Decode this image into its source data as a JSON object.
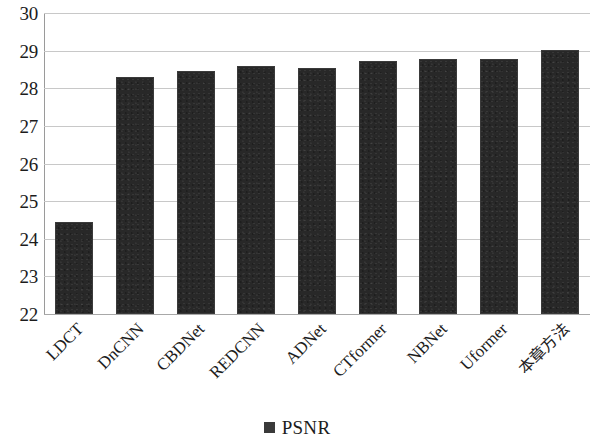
{
  "chart_data": {
    "type": "bar",
    "title": "",
    "subtitle": "",
    "xlabel": "",
    "ylabel": "",
    "categories": [
      "LDCT",
      "DnCNN",
      "CBDNet",
      "REDCNN",
      "ADNet",
      "CTformer",
      "NBNet",
      "Uformer",
      "本章方法"
    ],
    "series": [
      {
        "name": "PSNR",
        "values": [
          24.45,
          28.3,
          28.45,
          28.6,
          28.55,
          28.72,
          28.77,
          28.77,
          29.03
        ],
        "color": "#282828"
      }
    ],
    "ylim": [
      22,
      30
    ],
    "ytick_step": 1,
    "ytick_labels": [
      "30",
      "29",
      "28",
      "27",
      "26",
      "25",
      "24",
      "23",
      "22"
    ],
    "ytick_values": [
      30,
      29,
      28,
      27,
      26,
      25,
      24,
      23,
      22
    ],
    "grid": true,
    "grid_axis": "y",
    "grid_color": "#c8c8c8",
    "legend": {
      "position": "bottom",
      "entries": [
        {
          "label": "PSNR",
          "marker": "square",
          "color": "#3a3a3a"
        }
      ]
    },
    "xtick_rotation": -45,
    "background_color": "#ffffff",
    "axis_color": "#9a9a9a"
  }
}
